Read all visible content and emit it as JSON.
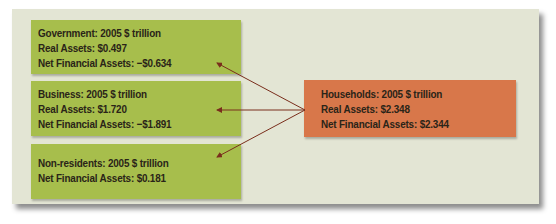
{
  "diagram": {
    "unit_note": "2005 $ trillion",
    "sectors": [
      {
        "id": "government",
        "lines": [
          "Government: 2005 $ trillion",
          "Real Assets: $0.497",
          "Net Financial Assets: −$0.634"
        ],
        "color": "#a7be4c"
      },
      {
        "id": "business",
        "lines": [
          "Business: 2005 $ trillion",
          "Real Assets: $1.720",
          "Net Financial Assets: −$1.891"
        ],
        "color": "#a7be4c"
      },
      {
        "id": "non-residents",
        "lines": [
          "Non-residents: 2005 $ trillion",
          "Net Financial Assets: $0.181"
        ],
        "color": "#a7be4c"
      },
      {
        "id": "households",
        "lines": [
          "Households: 2005 $ trillion",
          "Real Assets: $2.348",
          "Net Financial Assets: $2.344"
        ],
        "color": "#d8774a"
      }
    ],
    "arrows": [
      {
        "from": "households",
        "to": "government"
      },
      {
        "from": "households",
        "to": "business"
      },
      {
        "from": "households",
        "to": "non-residents"
      }
    ],
    "arrow_color": "#7a2e1c",
    "panel_color": "#e3e5d4"
  }
}
